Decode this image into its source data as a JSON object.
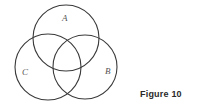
{
  "diagram": {
    "type": "venn",
    "sets": [
      {
        "label": "A",
        "cx": 66,
        "cy": 38,
        "r": 33,
        "label_x": 62,
        "label_y": 21
      },
      {
        "label": "C",
        "cx": 48,
        "cy": 67,
        "r": 33,
        "label_x": 22,
        "label_y": 75
      },
      {
        "label": "B",
        "cx": 85,
        "cy": 67,
        "r": 32,
        "label_x": 105,
        "label_y": 74
      }
    ],
    "stroke_color": "#3a3a3a"
  },
  "caption": "Figure 10"
}
